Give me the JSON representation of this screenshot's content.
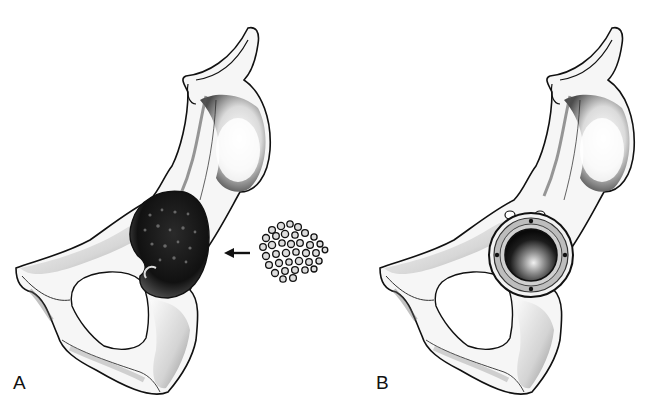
{
  "figure": {
    "panels": [
      {
        "label": "A",
        "subject": "hemipelvis-lateral-view",
        "features": [
          "acetabular-defect",
          "arrow",
          "morselized-bone-graft"
        ]
      },
      {
        "label": "B",
        "subject": "hemipelvis-lateral-view",
        "features": [
          "acetabular-cup-implant",
          "screw-holes"
        ]
      }
    ],
    "colors": {
      "background": "#ffffff",
      "ink": "#111111",
      "shadow": "#3a3a3a",
      "bone_light": "#f4f4f4"
    }
  }
}
